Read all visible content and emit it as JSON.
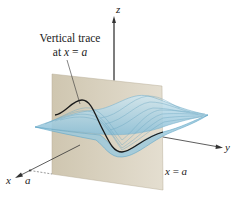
{
  "figure": {
    "callout_line1": "Vertical trace",
    "callout_line2_prefix": "at ",
    "callout_line2_var": "x",
    "callout_line2_eq": " = ",
    "callout_line2_val": "a",
    "plane_label_var": "x",
    "plane_label_eq": " = ",
    "plane_label_val": "a",
    "axis_x_label": "x",
    "axis_y_label": "y",
    "axis_z_label": "z",
    "tick_label": "a",
    "colors": {
      "plane": "#d8d0be",
      "surface": "#a9cfe0",
      "surface_edge": "#5fa6c8",
      "trace": "#1a1a1a",
      "axis": "#333333"
    }
  }
}
